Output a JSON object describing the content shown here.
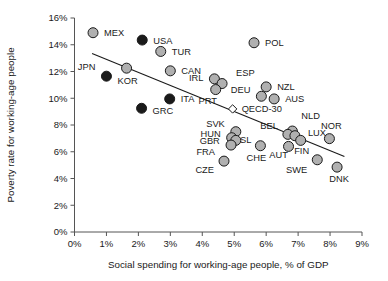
{
  "chart_data": {
    "type": "scatter",
    "title": "",
    "xlabel": "Social spending for working-age people, % of GDP",
    "ylabel": "Poverty rate for working-age people",
    "xlim": [
      0,
      9
    ],
    "ylim": [
      0,
      16
    ],
    "xticks": [
      "0%",
      "1%",
      "2%",
      "3%",
      "4%",
      "5%",
      "6%",
      "7%",
      "8%",
      "9%"
    ],
    "yticks": [
      "0%",
      "2%",
      "4%",
      "6%",
      "8%",
      "10%",
      "12%",
      "14%",
      "16%"
    ],
    "xtick_values": [
      0,
      1,
      2,
      3,
      4,
      5,
      6,
      7,
      8,
      9
    ],
    "ytick_values": [
      0,
      2,
      4,
      6,
      8,
      10,
      12,
      14,
      16
    ],
    "grid": false,
    "legend": "none",
    "marker_styles": {
      "light": "#b0b0b0",
      "dark": "#1a1a1a",
      "open": "#ffffff",
      "edge": "#1a1a1a"
    },
    "trendline": {
      "label": "linear fit",
      "x_start": 0.55,
      "y_start": 13.35,
      "x_end": 8.45,
      "y_end": 5.65
    },
    "points": [
      {
        "label": "MEX",
        "x": 0.58,
        "y": 14.9,
        "style": "light",
        "label_dx": 11,
        "label_dy": 3.5
      },
      {
        "label": "USA",
        "x": 2.12,
        "y": 14.35,
        "style": "dark",
        "label_dx": 11,
        "label_dy": 3.5
      },
      {
        "label": "TUR",
        "x": 2.7,
        "y": 13.5,
        "style": "light",
        "label_dx": 11,
        "label_dy": 3.5
      },
      {
        "label": "POL",
        "x": 5.62,
        "y": 14.15,
        "style": "light",
        "label_dx": 11,
        "label_dy": 3.5
      },
      {
        "label": "JPN",
        "x": 1.0,
        "y": 11.65,
        "style": "dark",
        "label_dx": -11,
        "label_dy": -6,
        "anchor": "end"
      },
      {
        "label": "KOR",
        "x": 1.63,
        "y": 12.25,
        "style": "light",
        "label_dx": 1,
        "label_dy": 16,
        "anchor": "middle"
      },
      {
        "label": "CAN",
        "x": 3.0,
        "y": 12.05,
        "style": "light",
        "label_dx": 11,
        "label_dy": 3.5
      },
      {
        "label": "IRL",
        "x": 4.38,
        "y": 11.45,
        "style": "light",
        "label_dx": -11,
        "label_dy": 2,
        "anchor": "end"
      },
      {
        "label": "ESP",
        "x": 4.62,
        "y": 11.1,
        "style": "light",
        "label_dx": 14,
        "label_dy": -8
      },
      {
        "label": "PRT",
        "x": 4.42,
        "y": 10.65,
        "style": "light",
        "label_dx": -8,
        "label_dy": 14,
        "anchor": "middle"
      },
      {
        "label": "DEU",
        "x": 5.85,
        "y": 10.15,
        "style": "light",
        "label_dx": -11,
        "label_dy": -3,
        "anchor": "end"
      },
      {
        "label": "NZL",
        "x": 6.0,
        "y": 10.85,
        "style": "light",
        "label_dx": 11,
        "label_dy": 3.5
      },
      {
        "label": "AUS",
        "x": 6.25,
        "y": 9.95,
        "style": "light",
        "label_dx": 11,
        "label_dy": 3.5
      },
      {
        "label": "ITA",
        "x": 2.98,
        "y": 9.95,
        "style": "dark",
        "label_dx": 11,
        "label_dy": 3.5
      },
      {
        "label": "GRC",
        "x": 2.1,
        "y": 9.25,
        "style": "dark",
        "label_dx": 11,
        "label_dy": 6
      },
      {
        "label": "QECD-30",
        "x": 4.95,
        "y": 9.2,
        "style": "open",
        "label_dx": 9,
        "label_dy": 3.5
      },
      {
        "label": "NLD",
        "x": 6.82,
        "y": 7.55,
        "style": "light",
        "label_dx": 9,
        "label_dy": -12
      },
      {
        "label": "BEL",
        "x": 6.68,
        "y": 7.3,
        "style": "light",
        "label_dx": -10,
        "label_dy": -5,
        "anchor": "end"
      },
      {
        "label": "LUX",
        "x": 6.9,
        "y": 7.2,
        "style": "light",
        "label_dx": 13,
        "label_dy": 0
      },
      {
        "label": "NOR",
        "x": 7.98,
        "y": 6.98,
        "style": "light",
        "label_dx": 2,
        "label_dy": -10,
        "anchor": "middle"
      },
      {
        "label": "SVK",
        "x": 5.05,
        "y": 7.5,
        "style": "light",
        "label_dx": -11,
        "label_dy": -5,
        "anchor": "end"
      },
      {
        "label": "HUN",
        "x": 4.92,
        "y": 7.05,
        "style": "light",
        "label_dx": -11,
        "label_dy": -1,
        "anchor": "end"
      },
      {
        "label": "GBR",
        "x": 5.05,
        "y": 6.85,
        "style": "light",
        "label_dx": -16,
        "label_dy": 4,
        "anchor": "end"
      },
      {
        "label": "FRA",
        "x": 4.9,
        "y": 6.5,
        "style": "light",
        "label_dx": -16,
        "label_dy": 10,
        "anchor": "end"
      },
      {
        "label": "SL",
        "x": 5.82,
        "y": 6.45,
        "style": "light",
        "label_dx": -9,
        "label_dy": -3,
        "anchor": "end"
      },
      {
        "label": "CHE",
        "x": 5.82,
        "y": 6.45,
        "style": "none",
        "label_dx": -4,
        "label_dy": 15,
        "anchor": "middle"
      },
      {
        "label": "AUT",
        "x": 6.7,
        "y": 6.4,
        "style": "light",
        "label_dx": -10,
        "label_dy": 12,
        "anchor": "middle"
      },
      {
        "label": "FIN",
        "x": 7.08,
        "y": 6.85,
        "style": "light",
        "label_dx": 1,
        "label_dy": 14,
        "anchor": "middle"
      },
      {
        "label": "CZE",
        "x": 4.68,
        "y": 5.3,
        "style": "light",
        "label_dx": -10,
        "label_dy": 12,
        "anchor": "end"
      },
      {
        "label": "SWE",
        "x": 7.6,
        "y": 5.4,
        "style": "light",
        "label_dx": -10,
        "label_dy": 13,
        "anchor": "end"
      },
      {
        "label": "DNK",
        "x": 8.22,
        "y": 4.85,
        "style": "light",
        "label_dx": 2,
        "label_dy": 15,
        "anchor": "middle"
      }
    ]
  }
}
